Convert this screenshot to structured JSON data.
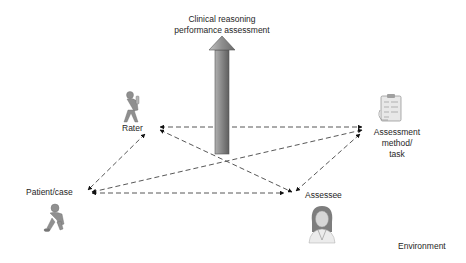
{
  "diagram": {
    "title_line1": "Clinical reasoning",
    "title_line2": "performance assessment",
    "nodes": {
      "rater": {
        "label": "Rater",
        "icon": "rater-figure-icon"
      },
      "assessment": {
        "label_line1": "Assessment",
        "label_line2": "method/",
        "label_line3": "task",
        "icon": "clipboard-checklist-icon"
      },
      "patient": {
        "label": "Patient/case",
        "icon": "patient-figure-icon"
      },
      "assessee": {
        "label": "Assessee",
        "icon": "doctor-portrait-icon"
      }
    },
    "environment_label": "Environment",
    "edges": [
      {
        "from": "Rater",
        "to": "Assessment method/task",
        "style": "dashed",
        "arrows": "both"
      },
      {
        "from": "Rater",
        "to": "Patient/case",
        "style": "dashed",
        "arrows": "both"
      },
      {
        "from": "Rater",
        "to": "Assessee",
        "style": "dashed",
        "arrows": "both"
      },
      {
        "from": "Patient/case",
        "to": "Assessment method/task",
        "style": "dashed",
        "arrows": "both"
      },
      {
        "from": "Patient/case",
        "to": "Assessee",
        "style": "dashed",
        "arrows": "both"
      },
      {
        "from": "Assessee",
        "to": "Assessment method/task",
        "style": "dashed",
        "arrows": "both"
      }
    ],
    "colors": {
      "arrow_fill": "#8c8c8c",
      "dash": "#444444",
      "text": "#262626"
    }
  }
}
